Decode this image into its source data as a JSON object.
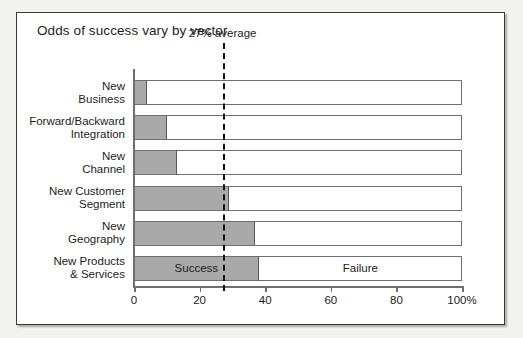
{
  "chart_data": {
    "type": "bar",
    "title": "Odds of success vary by vector",
    "orientation": "horizontal",
    "stacked": true,
    "xlabel": "",
    "ylabel": "",
    "xlim": [
      0,
      100
    ],
    "grid": false,
    "legend_position": "in-bar",
    "categories": [
      "New\nBusiness",
      "Forward/Backward\nIntegration",
      "New\nChannel",
      "New Customer\nSegment",
      "New\nGeography",
      "New Products\n& Services"
    ],
    "series": [
      {
        "name": "Success",
        "values": [
          4,
          10,
          13,
          29,
          37,
          38
        ]
      },
      {
        "name": "Failure",
        "values": [
          96,
          90,
          87,
          71,
          63,
          62
        ]
      }
    ],
    "tick_values": [
      0,
      20,
      40,
      60,
      80,
      100
    ],
    "tick_labels": [
      "0",
      "20",
      "40",
      "60",
      "80",
      "100%"
    ],
    "annotations": [
      {
        "name": "average-reference-line",
        "label": "27% average",
        "value": 27,
        "style": "dashed"
      }
    ],
    "segment_labels": {
      "success": "Success",
      "failure": "Failure"
    },
    "colors": {
      "success_fill": "#a9a9a9",
      "failure_fill": "#ffffff",
      "bar_stroke": "#6f6f6f",
      "axis": "#6f6f6f",
      "text": "#1d1d1d",
      "frame": "#3a3a3a",
      "page_background": "#f2f2f0"
    }
  }
}
